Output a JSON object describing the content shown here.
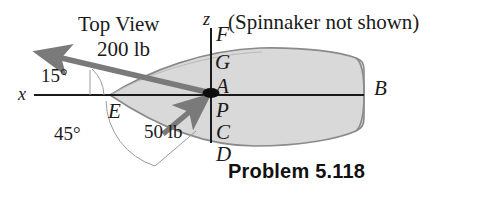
{
  "figure": {
    "title_note": "Top View",
    "side_note": "(Spinnaker not shown)",
    "caption": "Problem 5.118",
    "colors": {
      "hull_fill": "#d9d9d9",
      "hull_stroke": "#8a8a8a",
      "arrow": "#7a7a7a",
      "axis": "#1a1a1a",
      "arc": "#9a9a9a",
      "text": "#1a1a1a"
    }
  },
  "axes": [
    {
      "name": "x-axis",
      "label": "x"
    },
    {
      "name": "z-axis",
      "label": "z"
    }
  ],
  "forces": [
    {
      "name": "force-200lb",
      "label": "200 lb",
      "magnitude": 200,
      "unit": "lb",
      "direction": "up-left"
    },
    {
      "name": "force-50lb",
      "label": "50 lb",
      "magnitude": 50,
      "unit": "lb",
      "direction": "up-right"
    }
  ],
  "angles": [
    {
      "name": "angle-15",
      "label": "15°",
      "value": 15,
      "unit": "deg"
    },
    {
      "name": "angle-45",
      "label": "45°",
      "value": 45,
      "unit": "deg"
    }
  ],
  "points": [
    {
      "name": "point-F",
      "label": "F"
    },
    {
      "name": "point-G",
      "label": "G"
    },
    {
      "name": "point-A",
      "label": "A"
    },
    {
      "name": "point-P",
      "label": "P"
    },
    {
      "name": "point-C",
      "label": "C"
    },
    {
      "name": "point-D",
      "label": "D"
    },
    {
      "name": "point-E",
      "label": "E"
    },
    {
      "name": "point-B",
      "label": "B"
    }
  ]
}
